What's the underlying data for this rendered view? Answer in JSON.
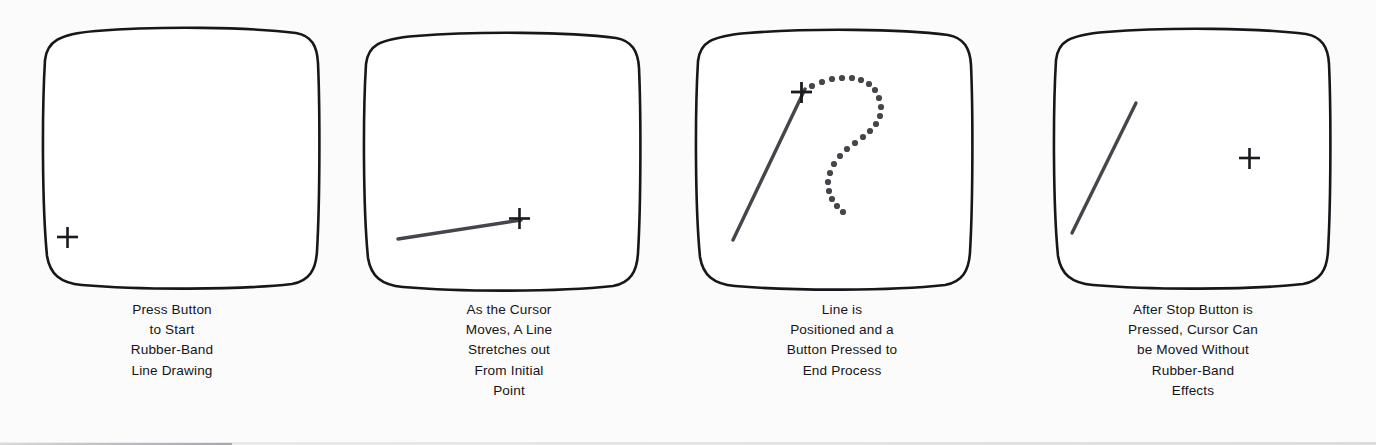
{
  "figure": {
    "background_color": "#fbfbfb",
    "ink_color": "#15151a",
    "stroke_color": "#3a3a40"
  },
  "panels": [
    {
      "id": "panel-1",
      "screen_name": "crt-screen-1",
      "caption_lines": [
        "Press Button",
        "to Start",
        "Rubber-Band",
        "Line Drawing"
      ],
      "cursor": {
        "name": "crosshair-cursor",
        "glyph": "+",
        "x": 67,
        "y": 237
      },
      "line": null,
      "dotted_path": null
    },
    {
      "id": "panel-2",
      "screen_name": "crt-screen-2",
      "caption_lines": [
        "As the Cursor",
        "Moves, A Line",
        "Stretches out",
        "From Initial",
        "Point"
      ],
      "cursor": {
        "name": "crosshair-cursor",
        "glyph": "+",
        "x": 519,
        "y": 218
      },
      "line": {
        "x1": 398,
        "y1": 239,
        "x2": 521,
        "y2": 220
      },
      "dotted_path": null
    },
    {
      "id": "panel-3",
      "screen_name": "crt-screen-3",
      "caption_lines": [
        "Line is",
        "Positioned and a",
        "Button Pressed to",
        "End Process"
      ],
      "cursor": {
        "name": "crosshair-cursor",
        "glyph": "+",
        "x": 801,
        "y": 92
      },
      "line": {
        "x1": 733,
        "y1": 240,
        "x2": 805,
        "y2": 89
      },
      "dotted_path": {
        "name": "dotted-cursor-trail",
        "dot_radius": 3.1,
        "dots": [
          [
            812,
            86
          ],
          [
            822,
            82
          ],
          [
            832,
            79
          ],
          [
            842,
            78
          ],
          [
            852,
            78
          ],
          [
            861,
            80
          ],
          [
            869,
            84
          ],
          [
            875,
            90
          ],
          [
            879,
            98
          ],
          [
            881,
            107
          ],
          [
            880,
            116
          ],
          [
            876,
            124
          ],
          [
            870,
            131
          ],
          [
            863,
            137
          ],
          [
            855,
            143
          ],
          [
            847,
            149
          ],
          [
            840,
            156
          ],
          [
            834,
            164
          ],
          [
            830,
            173
          ],
          [
            828,
            182
          ],
          [
            829,
            191
          ],
          [
            832,
            199
          ],
          [
            837,
            206
          ],
          [
            843,
            212
          ]
        ]
      }
    },
    {
      "id": "panel-4",
      "screen_name": "crt-screen-4",
      "caption_lines": [
        "After Stop Button is",
        "Pressed, Cursor Can",
        "be Moved Without",
        "Rubber-Band",
        "Effects"
      ],
      "cursor": {
        "name": "crosshair-cursor",
        "glyph": "+",
        "x": 1249,
        "y": 158
      },
      "line": {
        "x1": 1072,
        "y1": 233,
        "x2": 1136,
        "y2": 103
      },
      "dotted_path": null
    }
  ]
}
